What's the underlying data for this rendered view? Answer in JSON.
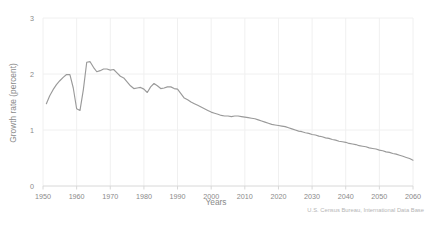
{
  "chart_data": {
    "type": "line",
    "title": "",
    "xlabel": "Years",
    "ylabel": "Growth rate (percent)",
    "xlim": [
      1950,
      2060
    ],
    "ylim": [
      0,
      3
    ],
    "grid": true,
    "legend": false,
    "xticks": [
      "1950",
      "1960",
      "1970",
      "1980",
      "1990",
      "2000",
      "2010",
      "2020",
      "2030",
      "2040",
      "2050",
      "2060"
    ],
    "yticks": [
      "0",
      "1",
      "2",
      "3"
    ],
    "source": "U.S. Census Bureau, International Data Base",
    "line_color": "#9a9a9a",
    "grid_color": "#f0f0f0",
    "axis_color": "#d8d8d8",
    "series": [
      {
        "name": "World population growth rate",
        "x": [
          1951,
          1952,
          1953,
          1954,
          1955,
          1956,
          1957,
          1958,
          1959,
          1960,
          1961,
          1962,
          1963,
          1964,
          1965,
          1966,
          1967,
          1968,
          1969,
          1970,
          1971,
          1972,
          1973,
          1974,
          1975,
          1976,
          1977,
          1978,
          1979,
          1980,
          1981,
          1982,
          1983,
          1984,
          1985,
          1986,
          1987,
          1988,
          1989,
          1990,
          1991,
          1992,
          1993,
          1994,
          1995,
          1996,
          1997,
          1998,
          1999,
          2000,
          2001,
          2002,
          2003,
          2004,
          2005,
          2006,
          2007,
          2008,
          2009,
          2010,
          2011,
          2012,
          2013,
          2014,
          2015,
          2016,
          2017,
          2018,
          2019,
          2020,
          2021,
          2022,
          2023,
          2024,
          2025,
          2026,
          2027,
          2028,
          2029,
          2030,
          2031,
          2032,
          2033,
          2034,
          2035,
          2036,
          2037,
          2038,
          2039,
          2040,
          2041,
          2042,
          2043,
          2044,
          2045,
          2046,
          2047,
          2048,
          2049,
          2050,
          2051,
          2052,
          2053,
          2054,
          2055,
          2056,
          2057,
          2058,
          2059,
          2060
        ],
        "values": [
          1.47,
          1.61,
          1.72,
          1.81,
          1.88,
          1.94,
          1.99,
          1.99,
          1.75,
          1.38,
          1.35,
          1.72,
          2.21,
          2.22,
          2.12,
          2.04,
          2.06,
          2.09,
          2.09,
          2.07,
          2.08,
          2.02,
          1.96,
          1.93,
          1.86,
          1.79,
          1.74,
          1.75,
          1.76,
          1.73,
          1.67,
          1.77,
          1.83,
          1.79,
          1.74,
          1.75,
          1.77,
          1.77,
          1.74,
          1.73,
          1.65,
          1.57,
          1.54,
          1.5,
          1.47,
          1.44,
          1.41,
          1.38,
          1.35,
          1.32,
          1.3,
          1.28,
          1.26,
          1.25,
          1.25,
          1.24,
          1.25,
          1.25,
          1.24,
          1.23,
          1.22,
          1.21,
          1.2,
          1.18,
          1.16,
          1.14,
          1.12,
          1.1,
          1.09,
          1.08,
          1.07,
          1.06,
          1.04,
          1.02,
          1.0,
          0.98,
          0.97,
          0.95,
          0.94,
          0.92,
          0.91,
          0.89,
          0.88,
          0.86,
          0.85,
          0.83,
          0.82,
          0.8,
          0.79,
          0.78,
          0.76,
          0.75,
          0.74,
          0.72,
          0.71,
          0.7,
          0.68,
          0.67,
          0.66,
          0.64,
          0.63,
          0.61,
          0.6,
          0.58,
          0.57,
          0.55,
          0.53,
          0.51,
          0.49,
          0.46
        ]
      }
    ]
  }
}
